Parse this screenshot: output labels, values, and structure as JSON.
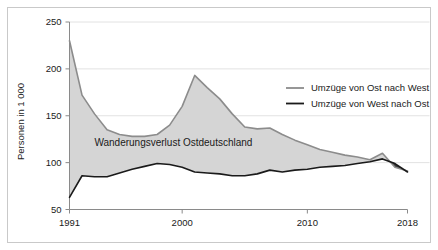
{
  "chart_data": {
    "type": "area",
    "title": "",
    "subtitle": "",
    "xlabel": "",
    "ylabel": "Personen in 1 000",
    "xlim": [
      1991,
      2018
    ],
    "ylim": [
      50,
      250
    ],
    "y_ticks": [
      50,
      100,
      150,
      200,
      250
    ],
    "x_ticks": [
      1991,
      2000,
      2010,
      2018
    ],
    "grid": "horizontal",
    "legend_position": "inside-right-upper",
    "x": [
      1991,
      1992,
      1993,
      1994,
      1995,
      1996,
      1997,
      1998,
      1999,
      2000,
      2001,
      2002,
      2003,
      2004,
      2005,
      2006,
      2007,
      2008,
      2009,
      2010,
      2011,
      2012,
      2013,
      2014,
      2015,
      2016,
      2017,
      2018
    ],
    "series": [
      {
        "name": "Umzüge von Ost nach West",
        "color": "#8c8c8c",
        "values": [
          230,
          172,
          152,
          135,
          130,
          128,
          128,
          130,
          140,
          160,
          193,
          180,
          168,
          152,
          138,
          136,
          137,
          130,
          124,
          119,
          114,
          111,
          108,
          106,
          103,
          110,
          95,
          91
        ]
      },
      {
        "name": "Umzüge von West nach Ost",
        "color": "#1a1a1a",
        "values": [
          63,
          86,
          85,
          85,
          89,
          93,
          96,
          99,
          98,
          95,
          90,
          89,
          88,
          86,
          86,
          88,
          92,
          90,
          92,
          93,
          95,
          96,
          97,
          99,
          101,
          104,
          99,
          90
        ]
      }
    ],
    "fill": {
      "label": "Wanderungsverlust Ostdeutschland",
      "color": "#d5d5d5",
      "crossover_color": "#3a3a3a"
    },
    "annotations": [
      {
        "text": "Wanderungsverlust Ostdeutschland",
        "x": 1999.3,
        "y": 118
      }
    ],
    "legend": [
      {
        "label": "Umzüge von Ost nach West",
        "color": "#8c8c8c"
      },
      {
        "label": "Umzüge von West nach Ost",
        "color": "#1a1a1a"
      }
    ]
  },
  "axis": {
    "y_title": "Personen in 1 000",
    "y_tick_labels": [
      "250",
      "200",
      "150",
      "100",
      "50"
    ],
    "x_tick_labels": [
      "1991",
      "2000",
      "2010",
      "2018"
    ]
  },
  "colors": {
    "frame": "#c9c9c9",
    "gridline": "#e2e2e2",
    "axis": "#8a8a8a",
    "area_fill": "#d5d5d5",
    "line_ost_west": "#8c8c8c",
    "line_west_ost": "#1a1a1a",
    "text": "#1a1a1a",
    "background": "#ffffff"
  }
}
